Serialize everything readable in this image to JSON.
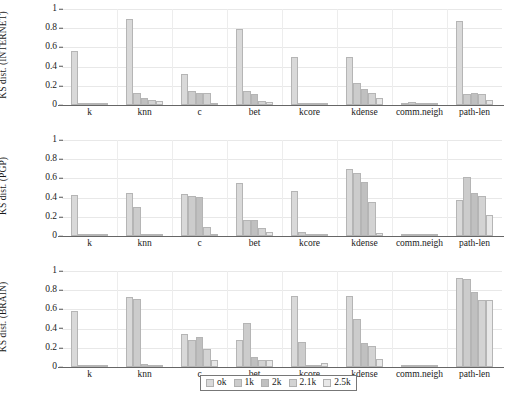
{
  "chart_data": {
    "type": "bar",
    "title": "",
    "grid": true,
    "legend_position": "bottom-center",
    "legend_entries": [
      "ok",
      "1k",
      "2k",
      "2.1k",
      "2.5k"
    ],
    "series_colors": [
      "#d9d9d9",
      "#cccccc",
      "#c0c0c0",
      "#d3d3d3",
      "#e8e8e8"
    ],
    "categories": [
      "k",
      "knn",
      "c",
      "bet",
      "kcore",
      "kdense",
      "comm.neigh",
      "path-len"
    ],
    "ylim": [
      0,
      1
    ],
    "yticks": [
      0,
      0.2,
      0.4,
      0.6,
      0.8,
      1
    ],
    "ytick_labels": [
      "0",
      "0.2",
      "0.4",
      "0.6",
      "0.8",
      "1"
    ],
    "xlabel": "",
    "panels": [
      {
        "ylabel": "KS dist. (INTERNET)",
        "series": [
          {
            "name": "ok",
            "values": [
              0.56,
              0.9,
              0.32,
              0.79,
              0.5,
              0.5,
              0.0,
              0.87
            ]
          },
          {
            "name": "1k",
            "values": [
              0.0,
              0.13,
              0.15,
              0.15,
              0.01,
              0.23,
              0.03,
              0.11
            ]
          },
          {
            "name": "2k",
            "values": [
              0.0,
              0.07,
              0.12,
              0.11,
              0.01,
              0.17,
              0.01,
              0.12
            ]
          },
          {
            "name": "2.1k",
            "values": [
              0.01,
              0.055,
              0.12,
              0.04,
              0.01,
              0.12,
              0.0,
              0.11
            ]
          },
          {
            "name": "2.5k",
            "values": [
              0.0,
              0.04,
              0.01,
              0.03,
              0.0,
              0.07,
              0.0,
              0.05
            ]
          }
        ]
      },
      {
        "ylabel": "KS dist. (PGP)",
        "series": [
          {
            "name": "ok",
            "values": [
              0.43,
              0.45,
              0.44,
              0.55,
              0.47,
              0.7,
              0.0,
              0.38
            ]
          },
          {
            "name": "1k",
            "values": [
              0.0,
              0.3,
              0.42,
              0.17,
              0.04,
              0.66,
              0.0,
              0.61
            ]
          },
          {
            "name": "2k",
            "values": [
              0.0,
              0.02,
              0.41,
              0.17,
              0.01,
              0.56,
              0.0,
              0.45
            ]
          },
          {
            "name": "2.1k",
            "values": [
              0.0,
              0.02,
              0.09,
              0.08,
              0.02,
              0.35,
              0.0,
              0.42
            ]
          },
          {
            "name": "2.5k",
            "values": [
              0.0,
              0.02,
              0.02,
              0.04,
              0.01,
              0.03,
              0.0,
              0.22
            ]
          }
        ]
      },
      {
        "ylabel": "KS dist. (BRAIN)",
        "series": [
          {
            "name": "ok",
            "values": [
              0.58,
              0.73,
              0.34,
              0.28,
              0.74,
              0.74,
              0.01,
              0.93
            ]
          },
          {
            "name": "1k",
            "values": [
              0.0,
              0.71,
              0.28,
              0.46,
              0.26,
              0.5,
              0.01,
              0.92
            ]
          },
          {
            "name": "2k",
            "values": [
              0.01,
              0.03,
              0.31,
              0.1,
              0.02,
              0.25,
              0.02,
              0.78
            ]
          },
          {
            "name": "2.1k",
            "values": [
              0.0,
              0.01,
              0.19,
              0.07,
              0.02,
              0.22,
              0.01,
              0.7
            ]
          },
          {
            "name": "2.5k",
            "values": [
              0.0,
              0.01,
              0.07,
              0.07,
              0.04,
              0.08,
              0.01,
              0.7
            ]
          }
        ]
      }
    ]
  }
}
